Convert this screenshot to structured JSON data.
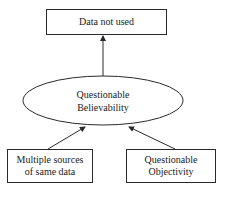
{
  "diagram": {
    "nodes": {
      "top": {
        "label": "Data not used",
        "shape": "rectangle"
      },
      "center": {
        "line1": "Questionable",
        "line2": "Believability",
        "shape": "ellipse"
      },
      "bottom_left": {
        "line1": "Multiple sources",
        "line2": "of same data",
        "shape": "rectangle"
      },
      "bottom_right": {
        "line1": "Questionable",
        "line2": "Objectivity",
        "shape": "rectangle"
      }
    },
    "edges": [
      {
        "from": "Questionable Believability",
        "to": "Data not used"
      },
      {
        "from": "Multiple sources of same data",
        "to": "Questionable Believability"
      },
      {
        "from": "Questionable Objectivity",
        "to": "Questionable Believability"
      }
    ],
    "colors": {
      "stroke": "#2a2a2a",
      "background": "#ffffff",
      "text": "#1a1a1a"
    }
  }
}
